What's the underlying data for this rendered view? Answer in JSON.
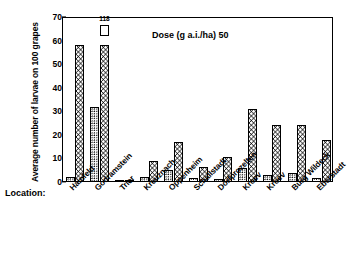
{
  "chart_data": {
    "type": "bar",
    "title": "",
    "xlabel": "Location:",
    "ylabel": "Average number of larvae on 100 grapes",
    "ylim": [
      0,
      70
    ],
    "ytick_values": [
      0,
      10,
      20,
      30,
      40,
      50,
      60,
      70
    ],
    "ytick_labels": [
      "0",
      "10",
      "20",
      "30",
      "40",
      "50",
      "60",
      "70"
    ],
    "grid": false,
    "legend_position": "none",
    "annotations": [
      {
        "text": "Dose (g a.i./ha) 50",
        "role": "dose-annotation"
      },
      {
        "text": "118",
        "role": "overflow-value-label",
        "series": "Untreated control",
        "category": "Godramstein"
      }
    ],
    "categories": [
      "Hainfeld",
      "Godramstein",
      "Trier",
      "Kreuznach",
      "Oppenheim",
      "Schallstadt",
      "Dorfprozelten",
      "Kroev",
      "Kroev",
      "Burg Wildeck",
      "Eberstadt"
    ],
    "series": [
      {
        "name": "Treated",
        "pattern": "dots",
        "values": [
          2.0,
          32.0,
          0.4,
          2.0,
          5.0,
          1.5,
          1.2,
          6.0,
          3.0,
          4.0,
          1.5
        ]
      },
      {
        "name": "Untreated control",
        "pattern": "checkerboard",
        "values": [
          58.0,
          58.0,
          1.0,
          9.0,
          17.0,
          6.5,
          10.5,
          31.0,
          24.0,
          24.0,
          18.0
        ],
        "clipped": [
          false,
          true,
          false,
          false,
          false,
          false,
          false,
          false,
          false,
          false,
          false
        ],
        "clipped_actual": [
          null,
          118,
          null,
          null,
          null,
          null,
          null,
          null,
          null,
          null,
          null
        ]
      }
    ]
  },
  "axis": {
    "y_title": "Average number of larvae on 100 grapes",
    "ticks": [
      {
        "label": "70",
        "value": 70
      },
      {
        "label": "60",
        "value": 60
      },
      {
        "label": "50",
        "value": 50
      },
      {
        "label": "40",
        "value": 40
      },
      {
        "label": "30",
        "value": 30
      },
      {
        "label": "20",
        "value": 20
      },
      {
        "label": "10",
        "value": 10
      },
      {
        "label": "0",
        "value": 0
      }
    ]
  },
  "labels": {
    "location_prefix": "Location:",
    "dose": "Dose (g a.i./ha) 50",
    "overflow": "118"
  }
}
